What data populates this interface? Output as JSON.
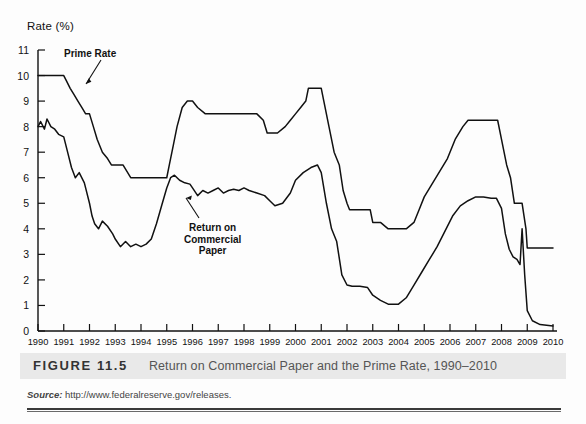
{
  "figure": {
    "number_label": "FIGURE 11.5",
    "caption": "Return on Commercial Paper and the Prime Rate, 1990–2010",
    "source_label": "Source:",
    "source_url": "http://www.federalreserve.gov/releases."
  },
  "annotations": {
    "prime_rate": "Prime Rate",
    "commercial_paper_line1": "Return on",
    "commercial_paper_line2": "Commercial",
    "commercial_paper_line3": "Paper"
  },
  "colors": {
    "line": "#111111",
    "axis": "#111111",
    "caption_band": "#e9e9e9",
    "caption_text": "#555555",
    "background": "#fdfdfd"
  },
  "chart_data": {
    "type": "line",
    "title": "Return on Commercial Paper and the Prime Rate, 1990–2010",
    "xlabel": "",
    "ylabel": "Rate (%)",
    "ylim": [
      0,
      11
    ],
    "xlim": [
      1990,
      2010
    ],
    "yticks": [
      0,
      1,
      2,
      3,
      4,
      5,
      6,
      7,
      8,
      9,
      10,
      11
    ],
    "xticks": [
      1990,
      1991,
      1992,
      1993,
      1994,
      1995,
      1996,
      1997,
      1998,
      1999,
      2000,
      2001,
      2002,
      2003,
      2004,
      2005,
      2006,
      2007,
      2008,
      2009,
      2010
    ],
    "grid": false,
    "legend": "annotated-inline",
    "series": [
      {
        "name": "Prime Rate",
        "x": [
          1990.0,
          1990.2,
          1990.5,
          1990.8,
          1991.0,
          1991.1,
          1991.25,
          1991.4,
          1991.55,
          1991.7,
          1991.85,
          1992.0,
          1992.15,
          1992.3,
          1992.5,
          1992.7,
          1992.85,
          1993.0,
          1993.3,
          1993.6,
          1994.0,
          1994.1,
          1994.3,
          1994.5,
          1994.7,
          1994.9,
          1995.0,
          1995.1,
          1995.25,
          1995.4,
          1995.6,
          1995.8,
          1996.0,
          1996.2,
          1996.5,
          1997.0,
          1997.2,
          1997.5,
          1998.0,
          1998.5,
          1998.75,
          1998.9,
          1999.0,
          1999.3,
          1999.6,
          1999.8,
          2000.0,
          2000.2,
          2000.4,
          2000.5,
          2000.8,
          2001.0,
          2001.1,
          2001.3,
          2001.5,
          2001.7,
          2001.85,
          2002.0,
          2002.1,
          2002.5,
          2002.9,
          2003.0,
          2003.3,
          2003.6,
          2004.0,
          2004.3,
          2004.6,
          2004.8,
          2005.0,
          2005.3,
          2005.6,
          2005.9,
          2006.2,
          2006.5,
          2006.7,
          2007.0,
          2007.4,
          2007.7,
          2007.85,
          2008.0,
          2008.2,
          2008.35,
          2008.5,
          2008.8,
          2008.95,
          2009.0,
          2009.3,
          2010.0
        ],
        "y": [
          10.0,
          10.0,
          10.0,
          10.0,
          10.0,
          9.8,
          9.5,
          9.25,
          9.0,
          8.75,
          8.5,
          8.5,
          8.0,
          7.5,
          7.0,
          6.75,
          6.5,
          6.5,
          6.5,
          6.0,
          6.0,
          6.0,
          6.0,
          6.0,
          6.0,
          6.0,
          6.0,
          6.5,
          7.25,
          8.0,
          8.75,
          9.0,
          9.0,
          8.75,
          8.5,
          8.5,
          8.5,
          8.5,
          8.5,
          8.5,
          8.25,
          7.75,
          7.75,
          7.75,
          8.0,
          8.25,
          8.5,
          8.75,
          9.0,
          9.5,
          9.5,
          9.5,
          9.0,
          8.0,
          7.0,
          6.5,
          5.5,
          5.0,
          4.75,
          4.75,
          4.75,
          4.25,
          4.25,
          4.0,
          4.0,
          4.0,
          4.25,
          4.75,
          5.25,
          5.75,
          6.25,
          6.75,
          7.5,
          8.0,
          8.25,
          8.25,
          8.25,
          8.25,
          8.25,
          7.5,
          6.5,
          6.0,
          5.0,
          5.0,
          4.0,
          3.25,
          3.25,
          3.25
        ],
        "color": "#111111"
      },
      {
        "name": "Return on Commercial Paper",
        "x": [
          1990.0,
          1990.1,
          1990.25,
          1990.35,
          1990.5,
          1990.65,
          1990.8,
          1991.0,
          1991.15,
          1991.3,
          1991.45,
          1991.6,
          1991.8,
          1992.0,
          1992.1,
          1992.2,
          1992.35,
          1992.5,
          1992.7,
          1992.9,
          1993.0,
          1993.2,
          1993.4,
          1993.6,
          1993.8,
          1994.0,
          1994.2,
          1994.4,
          1994.6,
          1994.8,
          1995.0,
          1995.15,
          1995.3,
          1995.5,
          1995.7,
          1995.9,
          1996.0,
          1996.2,
          1996.4,
          1996.6,
          1996.8,
          1997.0,
          1997.2,
          1997.4,
          1997.6,
          1997.8,
          1998.0,
          1998.2,
          1998.5,
          1998.8,
          1999.0,
          1999.2,
          1999.5,
          1999.8,
          2000.0,
          2000.3,
          2000.6,
          2000.85,
          2001.0,
          2001.2,
          2001.4,
          2001.6,
          2001.8,
          2002.0,
          2002.2,
          2002.5,
          2002.8,
          2003.0,
          2003.3,
          2003.6,
          2004.0,
          2004.3,
          2004.6,
          2004.9,
          2005.2,
          2005.5,
          2005.8,
          2006.1,
          2006.4,
          2006.7,
          2007.0,
          2007.3,
          2007.6,
          2007.8,
          2008.0,
          2008.15,
          2008.3,
          2008.45,
          2008.6,
          2008.72,
          2008.8,
          2008.9,
          2009.0,
          2009.2,
          2009.5,
          2010.0
        ],
        "y": [
          8.0,
          8.2,
          7.9,
          8.3,
          8.0,
          7.9,
          7.7,
          7.6,
          7.0,
          6.4,
          6.0,
          6.2,
          5.8,
          5.0,
          4.5,
          4.2,
          4.0,
          4.3,
          4.1,
          3.8,
          3.6,
          3.3,
          3.5,
          3.3,
          3.4,
          3.3,
          3.4,
          3.6,
          4.2,
          4.9,
          5.6,
          6.0,
          6.1,
          5.9,
          5.8,
          5.75,
          5.6,
          5.3,
          5.5,
          5.4,
          5.5,
          5.6,
          5.4,
          5.5,
          5.55,
          5.5,
          5.6,
          5.5,
          5.4,
          5.3,
          5.1,
          4.9,
          5.0,
          5.4,
          5.9,
          6.2,
          6.4,
          6.5,
          6.2,
          5.0,
          4.0,
          3.5,
          2.2,
          1.8,
          1.75,
          1.75,
          1.7,
          1.4,
          1.2,
          1.05,
          1.05,
          1.3,
          1.8,
          2.3,
          2.8,
          3.3,
          3.9,
          4.5,
          4.9,
          5.1,
          5.25,
          5.25,
          5.2,
          5.2,
          4.8,
          3.8,
          3.2,
          2.9,
          2.8,
          2.6,
          4.0,
          2.2,
          0.8,
          0.4,
          0.25,
          0.2
        ],
        "color": "#111111"
      }
    ]
  }
}
